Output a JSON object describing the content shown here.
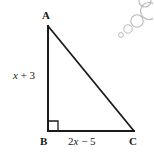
{
  "figure": {
    "type": "right-triangle-diagram",
    "background_color": "#ffffff",
    "line_color": "#1a1a1a",
    "decoration_color": "#b9b9bd",
    "vertices": [
      {
        "name": "A",
        "label": "A",
        "x": 48,
        "y": 26,
        "label_x": 42,
        "label_y": 10
      },
      {
        "name": "B",
        "label": "B",
        "x": 48,
        "y": 131,
        "label_x": 40,
        "label_y": 136
      },
      {
        "name": "C",
        "label": "C",
        "x": 134,
        "y": 131,
        "label_x": 129,
        "label_y": 136
      }
    ],
    "right_angle": {
      "at_vertex": "B",
      "marker_size": 10
    },
    "sides": [
      {
        "name": "leg-vertical",
        "from": "A",
        "to": "B",
        "label_variable": "x",
        "label_rest": " + 3",
        "label_full": "x + 3"
      },
      {
        "name": "leg-horizontal",
        "from": "B",
        "to": "C",
        "label_prefix": "2",
        "label_variable": "x",
        "label_rest": " − 5",
        "label_full": "2x − 5"
      },
      {
        "name": "hypotenuse",
        "from": "A",
        "to": "C",
        "label_full": ""
      }
    ],
    "decoration": {
      "name": "circle-chain",
      "circles": [
        {
          "cx": 121,
          "cy": 35,
          "r": 2.4
        },
        {
          "cx": 128,
          "cy": 29,
          "r": 4.2
        },
        {
          "cx": 137,
          "cy": 21,
          "r": 6.2
        },
        {
          "cx": 149,
          "cy": 11,
          "r": 8.5
        },
        {
          "cx": 145,
          "cy": 1,
          "r": 6.0
        }
      ]
    }
  }
}
